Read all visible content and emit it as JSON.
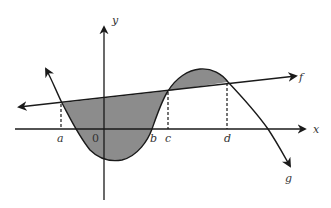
{
  "diagram": {
    "type": "area-between-curves",
    "colors": {
      "stroke": "#1a1a1a",
      "fill": "#8c8c8c",
      "background": "#ffffff"
    },
    "axes": {
      "x_label": "x",
      "y_label": "y",
      "origin_label": "0"
    },
    "curves": [
      {
        "name": "f",
        "label": "f",
        "shape": "line"
      },
      {
        "name": "g",
        "label": "g",
        "shape": "cubic"
      }
    ],
    "x_markers": [
      {
        "label": "a",
        "dashed_to_intersection": true
      },
      {
        "label": "b",
        "dashed_to_intersection": false
      },
      {
        "label": "c",
        "dashed_to_intersection": true
      },
      {
        "label": "d",
        "dashed_to_intersection": true
      }
    ],
    "shaded_regions": [
      {
        "from": "a",
        "to": "c",
        "between": [
          "f",
          "g"
        ]
      },
      {
        "from": "c",
        "to": "d",
        "between": [
          "f",
          "g"
        ]
      }
    ]
  }
}
